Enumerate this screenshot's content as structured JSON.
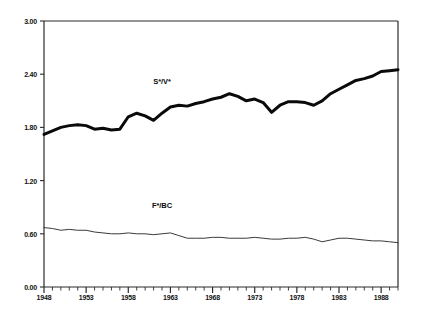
{
  "chart_data": {
    "type": "line",
    "title": "",
    "subtitle": "",
    "xlabel": "",
    "ylabel": "",
    "xlim": [
      1948,
      1990
    ],
    "ylim": [
      0.0,
      3.0
    ],
    "grid": false,
    "legend_position": "inline-annotation",
    "y_ticks": [
      "0.00",
      "0.60",
      "1.20",
      "1.80",
      "2.40",
      "3.00"
    ],
    "y_tick_values": [
      0.0,
      0.6,
      1.2,
      1.8,
      2.4,
      3.0
    ],
    "x_ticks": [
      "1948",
      "1953",
      "1958",
      "1963",
      "1968",
      "1973",
      "1978",
      "1983",
      "1988"
    ],
    "x_tick_values": [
      1948,
      1953,
      1958,
      1963,
      1968,
      1973,
      1978,
      1983,
      1988
    ],
    "x_minor_step": 1,
    "x": [
      1948,
      1949,
      1950,
      1951,
      1952,
      1953,
      1954,
      1955,
      1956,
      1957,
      1958,
      1959,
      1960,
      1961,
      1962,
      1963,
      1964,
      1965,
      1966,
      1967,
      1968,
      1969,
      1970,
      1971,
      1972,
      1973,
      1974,
      1975,
      1976,
      1977,
      1978,
      1979,
      1980,
      1981,
      1982,
      1983,
      1984,
      1985,
      1986,
      1987,
      1988,
      1989,
      1990
    ],
    "series": [
      {
        "name": "S*/V*",
        "label": "S*/V*",
        "color": "#0a0a0a",
        "linewidth": 3.0,
        "values": [
          1.72,
          1.76,
          1.8,
          1.82,
          1.83,
          1.82,
          1.78,
          1.79,
          1.77,
          1.78,
          1.92,
          1.96,
          1.93,
          1.88,
          1.96,
          2.03,
          2.05,
          2.04,
          2.07,
          2.09,
          2.12,
          2.14,
          2.18,
          2.15,
          2.1,
          2.12,
          2.08,
          1.97,
          2.05,
          2.09,
          2.09,
          2.08,
          2.05,
          2.1,
          2.18,
          2.23,
          2.28,
          2.33,
          2.35,
          2.38,
          2.43,
          2.44,
          2.45
        ]
      },
      {
        "name": "F*/BC",
        "label": "F*/BC",
        "color": "#3a3a3a",
        "linewidth": 1.0,
        "values": [
          0.67,
          0.66,
          0.64,
          0.65,
          0.64,
          0.64,
          0.62,
          0.61,
          0.6,
          0.6,
          0.61,
          0.6,
          0.6,
          0.59,
          0.6,
          0.61,
          0.58,
          0.55,
          0.55,
          0.55,
          0.56,
          0.56,
          0.55,
          0.55,
          0.55,
          0.56,
          0.55,
          0.54,
          0.54,
          0.55,
          0.55,
          0.56,
          0.54,
          0.51,
          0.53,
          0.55,
          0.55,
          0.54,
          0.53,
          0.52,
          0.52,
          0.51,
          0.5
        ]
      }
    ],
    "annotations": [
      {
        "text": "S*/V*",
        "x": 1962,
        "y": 2.32
      },
      {
        "text": "F*/BC",
        "x": 1962,
        "y": 0.93
      }
    ],
    "axis_color": "#2a2a2a",
    "background": "#ffffff"
  }
}
